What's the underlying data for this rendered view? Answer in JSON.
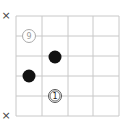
{
  "diagram": {
    "type": "go-board-fragment",
    "grid": {
      "x_lines": [
        16,
        42,
        68,
        93,
        119
      ],
      "y_lines": [
        16,
        36,
        56,
        76,
        96,
        116
      ],
      "line_color": "#c8c8c8"
    },
    "markers": [
      {
        "symbol": "×",
        "x": 6,
        "y": 16
      },
      {
        "symbol": "×",
        "x": 6,
        "y": 116
      }
    ],
    "stones": [
      {
        "color": "white",
        "label": "9",
        "x": 29,
        "y": 36,
        "style": "faint"
      },
      {
        "color": "black",
        "label": "",
        "x": 55,
        "y": 57
      },
      {
        "color": "black",
        "label": "",
        "x": 29,
        "y": 76
      },
      {
        "color": "white",
        "label": "1",
        "x": 55,
        "y": 96,
        "style": "double-ring"
      }
    ]
  }
}
